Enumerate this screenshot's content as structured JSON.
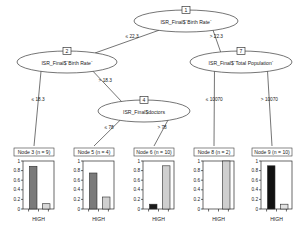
{
  "figure": {
    "type": "decision-tree-plot",
    "background": "#ffffff",
    "line_color": "#3a3a3a"
  },
  "chart_data": {
    "type": "tree",
    "title": "",
    "inner_nodes": [
      {
        "id": "1",
        "id_label": "1",
        "variable": "ISR_Final$`Birth Rate`",
        "left_edge": "≤ 22.3",
        "right_edge": "> 22.3",
        "cx": 186,
        "cy": 21,
        "rx": 52,
        "ry": 11
      },
      {
        "id": "2",
        "id_label": "2",
        "variable": "ISR_Final$`Birth Rate`",
        "left_edge": "≤ 18.3",
        "right_edge": "> 18.3",
        "cx": 67,
        "cy": 62,
        "rx": 50,
        "ry": 11
      },
      {
        "id": "7",
        "id_label": "7",
        "variable": "ISR_Final$`Total Population`",
        "left_edge": "≤ 10070",
        "right_edge": "> 10070",
        "cx": 241,
        "cy": 62,
        "rx": 51,
        "ry": 11
      },
      {
        "id": "4",
        "id_label": "4",
        "variable": "ISR_Final$doctors",
        "left_edge": "≤ 78",
        "right_edge": "> 78",
        "cx": 144,
        "cy": 111,
        "rx": 46,
        "ry": 11
      }
    ],
    "terminal_nodes": [
      {
        "id": "3",
        "header": "Node 3 (n = 9)",
        "n": 9,
        "xlabel": "HIGH",
        "ylim": [
          0,
          1
        ],
        "yticks": [
          "0",
          "0.2",
          "0.4",
          "0.6",
          "0.8",
          "1"
        ],
        "bars": [
          {
            "value": 0.89,
            "color": "#7a7a7a"
          },
          {
            "value": 0.11,
            "color": "#d9d9d9"
          }
        ]
      },
      {
        "id": "5",
        "header": "Node 5 (n = 4)",
        "n": 4,
        "xlabel": "HIGH",
        "ylim": [
          0,
          1
        ],
        "yticks": [
          "0",
          "0.2",
          "0.4",
          "0.6",
          "0.8",
          "1"
        ],
        "bars": [
          {
            "value": 0.75,
            "color": "#7a7a7a"
          },
          {
            "value": 0.25,
            "color": "#d0d0d0"
          }
        ]
      },
      {
        "id": "6",
        "header": "Node 6 (n = 10)",
        "n": 10,
        "xlabel": "HIGH",
        "ylim": [
          0,
          1
        ],
        "yticks": [
          "0",
          "0.2",
          "0.4",
          "0.6",
          "0.8",
          "1"
        ],
        "bars": [
          {
            "value": 0.1,
            "color": "#1a1a1a"
          },
          {
            "value": 0.9,
            "color": "#cfcfcf"
          }
        ]
      },
      {
        "id": "8",
        "header": "Node 8 (n = 2)",
        "n": 2,
        "xlabel": "HIGH",
        "ylim": [
          0,
          1
        ],
        "yticks": [
          "0",
          "0.2",
          "0.4",
          "0.6",
          "0.8",
          "1"
        ],
        "bars": [
          {
            "value": 0.0,
            "color": "#1a1a1a"
          },
          {
            "value": 1.0,
            "color": "#cfcfcf"
          }
        ]
      },
      {
        "id": "9",
        "header": "Node 9 (n = 10)",
        "n": 10,
        "xlabel": "HIGH",
        "ylim": [
          0,
          1
        ],
        "yticks": [
          "0",
          "0.2",
          "0.4",
          "0.6",
          "0.8",
          "1"
        ],
        "bars": [
          {
            "value": 0.9,
            "color": "#111111"
          },
          {
            "value": 0.1,
            "color": "#e2e2e2"
          }
        ]
      }
    ]
  }
}
